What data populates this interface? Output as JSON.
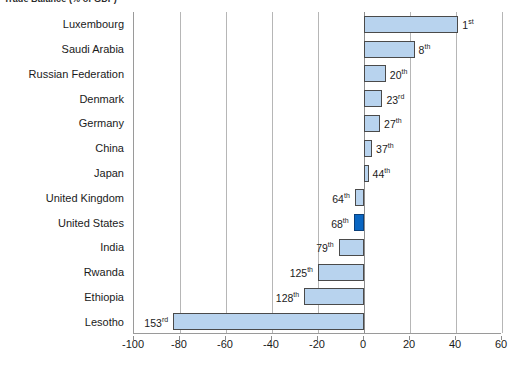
{
  "chart_data": {
    "type": "bar",
    "orientation": "horizontal",
    "title": "Trade Balance (% of GDP)",
    "xlabel": "",
    "ylabel": "",
    "xlim": [
      -100,
      60
    ],
    "xticks": [
      -100,
      -80,
      -60,
      -40,
      -20,
      0,
      20,
      40,
      60
    ],
    "grid": true,
    "legend": "none",
    "categories": [
      "Luxembourg",
      "Saudi Arabia",
      "Russian Federation",
      "Denmark",
      "Germany",
      "China",
      "Japan",
      "United Kingdom",
      "United States",
      "India",
      "Rwanda",
      "Ethiopia",
      "Lesotho"
    ],
    "values": [
      41,
      22,
      9.5,
      8,
      7,
      3.5,
      2,
      -4,
      -4.5,
      -11,
      -20,
      -26,
      -83
    ],
    "annotations": [
      {
        "category": "Luxembourg",
        "rank": 1,
        "suffix": "st",
        "label": "1st"
      },
      {
        "category": "Saudi Arabia",
        "rank": 8,
        "suffix": "th",
        "label": "8th"
      },
      {
        "category": "Russian Federation",
        "rank": 20,
        "suffix": "th",
        "label": "20th"
      },
      {
        "category": "Denmark",
        "rank": 23,
        "suffix": "rd",
        "label": "23rd"
      },
      {
        "category": "Germany",
        "rank": 27,
        "suffix": "th",
        "label": "27th"
      },
      {
        "category": "China",
        "rank": 37,
        "suffix": "th",
        "label": "37th"
      },
      {
        "category": "Japan",
        "rank": 44,
        "suffix": "th",
        "label": "44th"
      },
      {
        "category": "United Kingdom",
        "rank": 64,
        "suffix": "th",
        "label": "64th"
      },
      {
        "category": "United States",
        "rank": 68,
        "suffix": "th",
        "label": "68th"
      },
      {
        "category": "India",
        "rank": 79,
        "suffix": "th",
        "label": "79th"
      },
      {
        "category": "Rwanda",
        "rank": 125,
        "suffix": "th",
        "label": "125th"
      },
      {
        "category": "Ethiopia",
        "rank": 128,
        "suffix": "th",
        "label": "128th"
      },
      {
        "category": "Lesotho",
        "rank": 153,
        "suffix": "rd",
        "label": "153rd"
      }
    ],
    "highlight_category": "United States",
    "colors": {
      "bar_fill": "#b8d3ee",
      "bar_border": "#4a4a4a",
      "highlight_fill": "#0a66c2",
      "highlight_border": "#0a3f7a",
      "gridline": "#b6b6b6",
      "axis": "#8c8c8c",
      "text": "#1a1a1a",
      "background": "#ffffff"
    }
  },
  "axis": {
    "tick_labels": [
      "-100",
      "-80",
      "-60",
      "-40",
      "-20",
      "0",
      "20",
      "40",
      "60"
    ]
  },
  "title": {
    "text": "Trade Balance (% of GDP)"
  }
}
